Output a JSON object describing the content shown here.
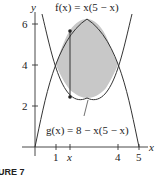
{
  "figure": {
    "caption": "URE 7",
    "y_axis_label": "y",
    "x_axis_label": "x",
    "f_label": "f(x) = x(5 − x)",
    "g_label": "g(x) = 8 − x(5 − x)",
    "x_ticks": [
      {
        "value": 1,
        "label": "1"
      },
      {
        "value": 1.7,
        "label": "x"
      },
      {
        "value": 4,
        "label": "4"
      },
      {
        "value": 5,
        "label": "5"
      }
    ],
    "y_ticks": [
      {
        "value": 2,
        "label": "2"
      },
      {
        "value": 4,
        "label": "4"
      },
      {
        "value": 6,
        "label": "6"
      }
    ],
    "colors": {
      "shade": "#c8c8c8",
      "curve": "#333333",
      "axis": "#333333"
    }
  }
}
